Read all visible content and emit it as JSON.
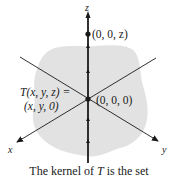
{
  "figure": {
    "axes": {
      "x_label": "x",
      "y_label": "y",
      "z_label": "z"
    },
    "points": {
      "kernel_point": "(0, 0, z)",
      "origin": "(0, 0, 0)"
    },
    "transform": {
      "line1": "T(x, y, z) =",
      "line2": "(x, y, 0)"
    },
    "colors": {
      "region": "#e2e2e2",
      "axis": "#1a1a1a"
    },
    "caption": {
      "prefix": "The kernel of ",
      "symbol": "T",
      "suffix": " is the set"
    }
  }
}
